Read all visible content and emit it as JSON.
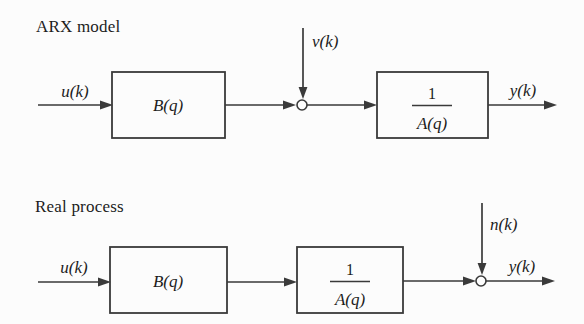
{
  "figure": {
    "type": "block-diagram",
    "background_color": "#fcfcfc",
    "line_color": "#3a3a3a",
    "text_color": "#1d1d1d"
  },
  "diagrams": [
    {
      "title": "ARX model",
      "input_signal": "u(k)",
      "disturbance_signal": "v(k)",
      "output_signal": "y(k)",
      "block_b": "B(q)",
      "block_a_numerator": "1",
      "block_a_denominator": "A(q)",
      "structure_note": "disturbance enters summing junction before 1/A(q) block"
    },
    {
      "title": "Real process",
      "input_signal": "u(k)",
      "disturbance_signal": "n(k)",
      "output_signal": "y(k)",
      "block_b": "B(q)",
      "block_a_numerator": "1",
      "block_a_denominator": "A(q)",
      "structure_note": "noise enters summing junction after 1/A(q) block at output"
    }
  ]
}
